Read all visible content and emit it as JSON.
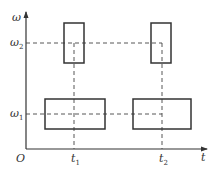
{
  "diagram": {
    "axes": {
      "y_label": "ω",
      "x_label": "t",
      "origin_label": "O"
    },
    "y_ticks": [
      {
        "label": "ω",
        "subscript": "2"
      },
      {
        "label": "ω",
        "subscript": "1"
      }
    ],
    "x_ticks": [
      {
        "label": "t",
        "subscript": "1"
      },
      {
        "label": "t",
        "subscript": "2"
      }
    ],
    "pulses": [
      {
        "name": "high-pulse-1",
        "level": "ω2",
        "center": "t1",
        "shape": "tall-narrow"
      },
      {
        "name": "low-pulse-1",
        "level": "ω1",
        "center": "t1",
        "shape": "wide-short"
      },
      {
        "name": "high-pulse-2",
        "level": "ω2",
        "center": "t2",
        "shape": "tall-narrow"
      },
      {
        "name": "low-pulse-2",
        "level": "ω1",
        "center": "t2",
        "shape": "wide-short"
      }
    ],
    "colors": {
      "stroke": "#333333",
      "background": "#ffffff"
    }
  }
}
